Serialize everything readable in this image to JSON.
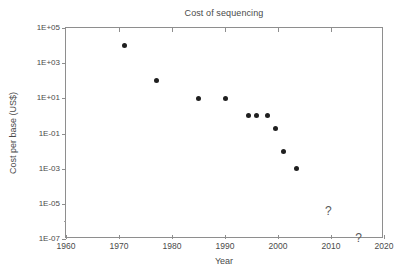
{
  "chart_data": {
    "type": "scatter",
    "title": "Cost of sequencing",
    "xlabel": "Year",
    "ylabel": "Cost per base (US$)",
    "xlim": [
      1960,
      2020
    ],
    "ylim": [
      1e-07,
      100000.0
    ],
    "yscale": "log",
    "grid": false,
    "legend": null,
    "xticks": [
      1960,
      1970,
      1980,
      1990,
      2000,
      2010,
      2020
    ],
    "xticklabels": [
      "1960",
      "1970",
      "1980",
      "1990",
      "2000",
      "2010",
      "2020"
    ],
    "yticks": [
      1e-07,
      1e-05,
      0.001,
      0.1,
      10.0,
      1000.0,
      100000.0
    ],
    "yticklabels": [
      "1E-07",
      "1E-05",
      "1E-03",
      "1E-01",
      "1E+01",
      "1E+03",
      "1E+05"
    ],
    "series": [
      {
        "name": "Cost per base",
        "marker": "filled-circle",
        "color": "#1f1f1f",
        "points": [
          {
            "x": 1971,
            "y": 10000
          },
          {
            "x": 1977,
            "y": 100
          },
          {
            "x": 1985,
            "y": 10
          },
          {
            "x": 1990,
            "y": 10
          },
          {
            "x": 1994.5,
            "y": 1
          },
          {
            "x": 1996,
            "y": 1
          },
          {
            "x": 1998,
            "y": 1
          },
          {
            "x": 1999.5,
            "y": 0.2
          },
          {
            "x": 2001,
            "y": 0.01
          },
          {
            "x": 2003.5,
            "y": 0.001
          }
        ]
      }
    ],
    "annotations": [
      {
        "text": "?",
        "x": 2009.5,
        "y": 4e-06
      },
      {
        "text": "?",
        "x": 2015.2,
        "y": 1.2e-07
      }
    ]
  }
}
